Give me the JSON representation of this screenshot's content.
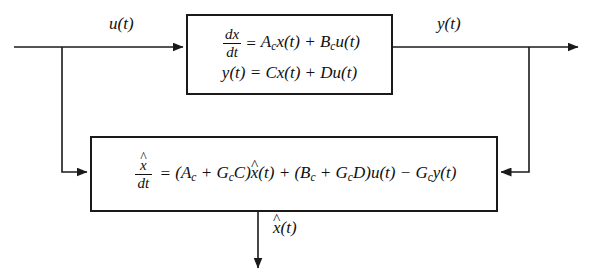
{
  "diagram": {
    "stroke_color": "#1a1a1a",
    "background_color": "#ffffff",
    "plant_block": {
      "name": "plant-state-space-block",
      "equation_1": {
        "lhs_numerator": "dx",
        "lhs_denominator": "dt",
        "equals": "=",
        "rhs": "Acx(t) + Bcu(t)",
        "rhs_terms": [
          "A_c x(t)",
          "B_c u(t)"
        ],
        "plain": "dx/dt = A_c x(t) + B_c u(t)"
      },
      "equation_2": {
        "lhs": "y(t)",
        "equals": "=",
        "rhs": "Cx(t) + Du(t)",
        "rhs_terms": [
          "C x(t)",
          "D u(t)"
        ],
        "plain": "y(t) = Cx(t) + Du(t)"
      }
    },
    "observer_block": {
      "name": "observer-block",
      "equation": {
        "lhs_numerator": "dx̂",
        "lhs_denominator": "dt",
        "equals": "=",
        "rhs_terms": [
          "(A_c + G_c C) x̂(t)",
          "(B_c + G_c D) u(t)",
          "− G_c y(t)"
        ],
        "plain": "dx̂/dt = (A_c + G_c C)x̂(t) + (B_c + G_c D)u(t) − G_c y(t)"
      }
    },
    "signals": {
      "input": {
        "label": "u(t)",
        "description": "control input"
      },
      "output": {
        "label": "y(t)",
        "description": "measured plant output"
      },
      "estimate": {
        "label": "x̂(t)",
        "description": "estimated state"
      }
    },
    "symbols": {
      "x_hat": "x̂",
      "hat": "̂",
      "caret": "^",
      "minus": "−",
      "plus": "+",
      "equals": "="
    },
    "wires": [
      {
        "name": "input-wire",
        "from": "left-edge",
        "to": "plant-block-left"
      },
      {
        "name": "input-branch-wire",
        "from": "input-junction",
        "to": "observer-block-left"
      },
      {
        "name": "output-wire",
        "from": "plant-block-right",
        "to": "right-edge"
      },
      {
        "name": "output-feedback-wire",
        "from": "output-junction",
        "to": "observer-block-right"
      },
      {
        "name": "estimate-output-wire",
        "from": "observer-block-bottom",
        "to": "below"
      }
    ]
  }
}
